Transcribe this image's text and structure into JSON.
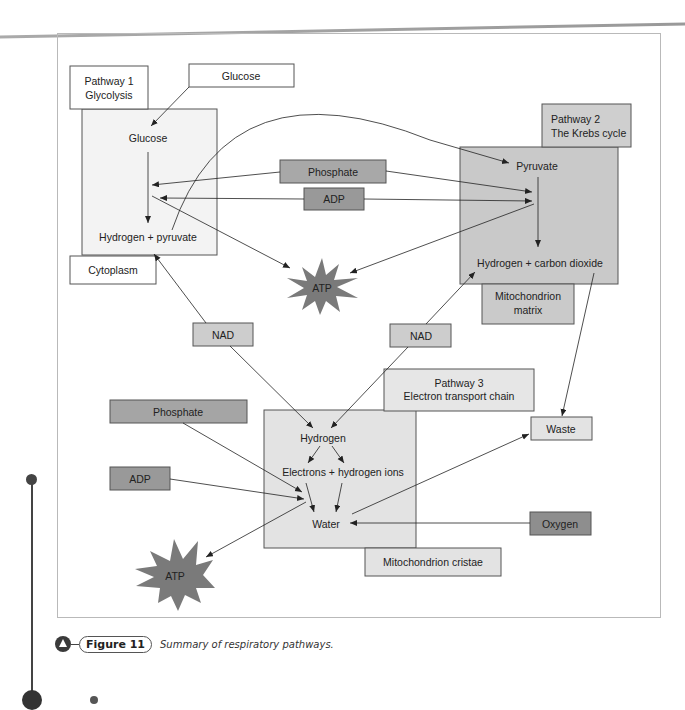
{
  "figure": {
    "number_label": "Figure 11",
    "caption": "Summary of respiratory pathways."
  },
  "pathway1": {
    "title_line1": "Pathway 1",
    "title_line2": "Glycolysis",
    "input_label": "Glucose",
    "start": "Glucose",
    "end": "Hydrogen + pyruvate",
    "location": "Cytoplasm"
  },
  "pathway2": {
    "title_line1": "Pathway 2",
    "title_line2": "The Krebs cycle",
    "start": "Pyruvate",
    "end": "Hydrogen + carbon dioxide",
    "location_line1": "Mitochondrion",
    "location_line2": "matrix"
  },
  "pathway3": {
    "title_line1": "Pathway 3",
    "title_line2": "Electron transport chain",
    "start": "Hydrogen",
    "middle": "Electrons + hydrogen ions",
    "end": "Water",
    "location": "Mitochondrion cristae"
  },
  "inputs": {
    "phosphate_top": "Phosphate",
    "adp_top": "ADP",
    "phosphate_bottom": "Phosphate",
    "adp_bottom": "ADP",
    "nad_left": "NAD",
    "nad_right": "NAD",
    "oxygen": "Oxygen"
  },
  "outputs": {
    "atp_top": "ATP",
    "atp_bottom": "ATP",
    "waste": "Waste"
  },
  "colors": {
    "light_box": "#efefef",
    "mid_box": "#c8c8c8",
    "dark_box": "#a5a5a5",
    "darkest_box": "#8e8e8e",
    "atp_star": "#7a7a7a",
    "line": "#333333"
  }
}
